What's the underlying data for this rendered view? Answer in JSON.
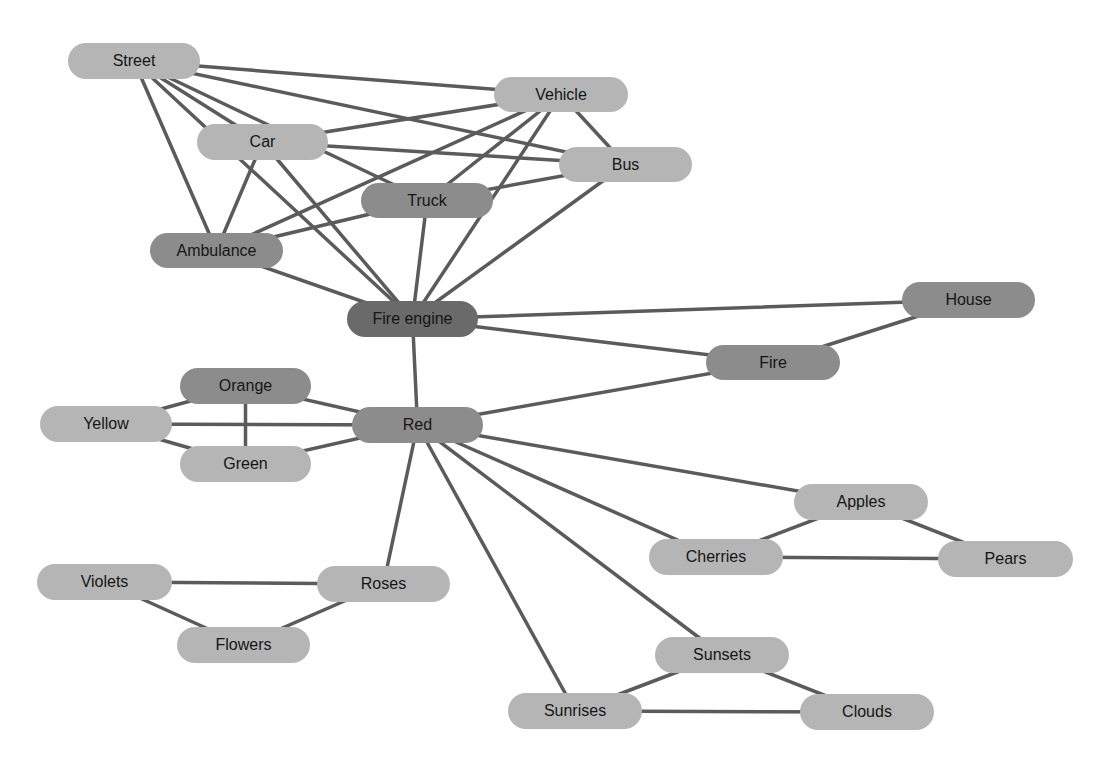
{
  "diagram": {
    "type": "concept-network",
    "nodes": [
      {
        "id": "street",
        "label": "Street",
        "x": 68,
        "y": 43,
        "w": 132,
        "h": 36,
        "shade": "light"
      },
      {
        "id": "vehicle",
        "label": "Vehicle",
        "x": 494,
        "y": 77,
        "w": 134,
        "h": 35,
        "shade": "light"
      },
      {
        "id": "car",
        "label": "Car",
        "x": 197,
        "y": 124,
        "w": 131,
        "h": 36,
        "shade": "light"
      },
      {
        "id": "bus",
        "label": "Bus",
        "x": 559,
        "y": 147,
        "w": 133,
        "h": 35,
        "shade": "light"
      },
      {
        "id": "truck",
        "label": "Truck",
        "x": 361,
        "y": 183,
        "w": 132,
        "h": 35,
        "shade": "mid"
      },
      {
        "id": "ambulance",
        "label": "Ambulance",
        "x": 150,
        "y": 233,
        "w": 133,
        "h": 35,
        "shade": "mid"
      },
      {
        "id": "fire_engine",
        "label": "Fire engine",
        "x": 347,
        "y": 301,
        "w": 131,
        "h": 36,
        "shade": "dark"
      },
      {
        "id": "house",
        "label": "House",
        "x": 902,
        "y": 282,
        "w": 133,
        "h": 36,
        "shade": "mid"
      },
      {
        "id": "fire",
        "label": "Fire",
        "x": 706,
        "y": 345,
        "w": 134,
        "h": 35,
        "shade": "mid"
      },
      {
        "id": "orange",
        "label": "Orange",
        "x": 180,
        "y": 368,
        "w": 131,
        "h": 36,
        "shade": "mid"
      },
      {
        "id": "yellow",
        "label": "Yellow",
        "x": 40,
        "y": 406,
        "w": 132,
        "h": 36,
        "shade": "light"
      },
      {
        "id": "red",
        "label": "Red",
        "x": 352,
        "y": 407,
        "w": 131,
        "h": 36,
        "shade": "mid"
      },
      {
        "id": "green",
        "label": "Green",
        "x": 180,
        "y": 446,
        "w": 131,
        "h": 36,
        "shade": "light"
      },
      {
        "id": "apples",
        "label": "Apples",
        "x": 794,
        "y": 484,
        "w": 134,
        "h": 36,
        "shade": "light"
      },
      {
        "id": "cherries",
        "label": "Cherries",
        "x": 649,
        "y": 539,
        "w": 134,
        "h": 36,
        "shade": "light"
      },
      {
        "id": "pears",
        "label": "Pears",
        "x": 938,
        "y": 541,
        "w": 135,
        "h": 36,
        "shade": "light"
      },
      {
        "id": "violets",
        "label": "Violets",
        "x": 37,
        "y": 564,
        "w": 135,
        "h": 36,
        "shade": "light"
      },
      {
        "id": "roses",
        "label": "Roses",
        "x": 317,
        "y": 566,
        "w": 133,
        "h": 36,
        "shade": "light"
      },
      {
        "id": "flowers",
        "label": "Flowers",
        "x": 177,
        "y": 627,
        "w": 133,
        "h": 36,
        "shade": "light"
      },
      {
        "id": "sunsets",
        "label": "Sunsets",
        "x": 655,
        "y": 637,
        "w": 134,
        "h": 36,
        "shade": "light"
      },
      {
        "id": "sunrises",
        "label": "Sunrises",
        "x": 508,
        "y": 693,
        "w": 134,
        "h": 36,
        "shade": "light"
      },
      {
        "id": "clouds",
        "label": "Clouds",
        "x": 800,
        "y": 694,
        "w": 134,
        "h": 36,
        "shade": "light"
      }
    ],
    "edges": [
      [
        "street",
        "vehicle"
      ],
      [
        "street",
        "bus"
      ],
      [
        "street",
        "truck"
      ],
      [
        "street",
        "car"
      ],
      [
        "street",
        "ambulance"
      ],
      [
        "street",
        "fire_engine"
      ],
      [
        "street",
        "fire_engine_b"
      ],
      [
        "vehicle",
        "car"
      ],
      [
        "vehicle",
        "ambulance"
      ],
      [
        "vehicle",
        "truck"
      ],
      [
        "vehicle",
        "bus"
      ],
      [
        "vehicle",
        "fire_engine"
      ],
      [
        "car",
        "bus"
      ],
      [
        "car",
        "ambulance"
      ],
      [
        "car",
        "fire_engine"
      ],
      [
        "bus",
        "truck"
      ],
      [
        "bus",
        "fire_engine"
      ],
      [
        "truck",
        "ambulance"
      ],
      [
        "truck",
        "fire_engine"
      ],
      [
        "ambulance",
        "fire_engine"
      ],
      [
        "fire_engine",
        "house"
      ],
      [
        "fire_engine",
        "fire"
      ],
      [
        "fire_engine",
        "red"
      ],
      [
        "house",
        "fire"
      ],
      [
        "fire",
        "red"
      ],
      [
        "red",
        "orange"
      ],
      [
        "red",
        "yellow"
      ],
      [
        "red",
        "green"
      ],
      [
        "orange",
        "yellow"
      ],
      [
        "orange",
        "green"
      ],
      [
        "yellow",
        "green"
      ],
      [
        "red",
        "roses"
      ],
      [
        "red",
        "apples"
      ],
      [
        "red",
        "cherries"
      ],
      [
        "red",
        "sunsets"
      ],
      [
        "red",
        "sunrises"
      ],
      [
        "violets",
        "roses"
      ],
      [
        "violets",
        "flowers"
      ],
      [
        "roses",
        "flowers"
      ],
      [
        "apples",
        "cherries"
      ],
      [
        "apples",
        "pears"
      ],
      [
        "cherries",
        "pears"
      ],
      [
        "sunsets",
        "sunrises"
      ],
      [
        "sunsets",
        "clouds"
      ],
      [
        "sunrises",
        "clouds"
      ]
    ],
    "colors": {
      "light": "#b5b5b5",
      "mid": "#8c8c8c",
      "dark": "#6a6a6a",
      "edge": "#5b5b5b",
      "text": "#161616"
    }
  }
}
